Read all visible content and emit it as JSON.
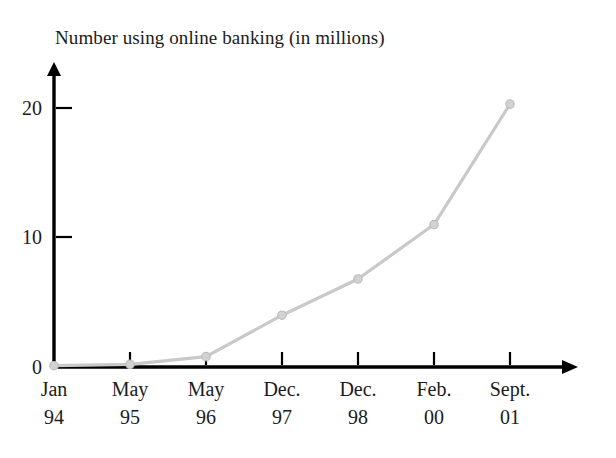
{
  "chart_data": {
    "type": "line",
    "title": "Number using online banking (in millions)",
    "xlabel": "",
    "ylabel": "",
    "categories": [
      "Jan 94",
      "May 95",
      "May 96",
      "Dec. 97",
      "Dec. 98",
      "Feb. 00",
      "Sept. 01"
    ],
    "category_lines": [
      {
        "line1": "Jan",
        "line2": "94"
      },
      {
        "line1": "May",
        "line2": "95"
      },
      {
        "line1": "May",
        "line2": "96"
      },
      {
        "line1": "Dec.",
        "line2": "97"
      },
      {
        "line1": "Dec.",
        "line2": "98"
      },
      {
        "line1": "Feb.",
        "line2": "00"
      },
      {
        "line1": "Sept.",
        "line2": "01"
      }
    ],
    "values": [
      0.1,
      0.2,
      0.8,
      4,
      6.8,
      11,
      20.3
    ],
    "y_ticks": [
      0,
      10,
      20
    ],
    "y_tick_labels": [
      "0",
      "10",
      "20"
    ],
    "ylim": [
      0,
      23
    ],
    "grid": false,
    "legend": false,
    "series_color": "#c9c9c9",
    "axis_color": "#000000",
    "marker": "circle",
    "axis_arrows": true
  },
  "geometry": {
    "x_positions": [
      54,
      130,
      206,
      282,
      358,
      434,
      510
    ],
    "y_positions": [
      366,
      364,
      357,
      315,
      279,
      226,
      104
    ],
    "baseline_y": 367,
    "axis_x": 54,
    "y_tick_pixels": [
      367,
      237,
      108
    ],
    "x_axis_end": 578,
    "y_axis_top": 62
  }
}
